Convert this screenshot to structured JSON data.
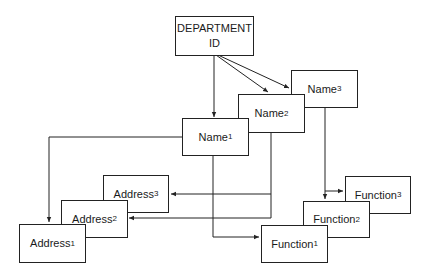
{
  "diagram": {
    "root": {
      "line1": "DEPARTMENT",
      "line2": "ID"
    },
    "names": [
      {
        "label": "Name",
        "sub": "1"
      },
      {
        "label": "Name",
        "sub": "2"
      },
      {
        "label": "Name",
        "sub": "3"
      }
    ],
    "addresses": [
      {
        "label": "Address",
        "sub": "1"
      },
      {
        "label": "Address",
        "sub": "2"
      },
      {
        "label": "Address",
        "sub": "3"
      }
    ],
    "functions": [
      {
        "label": "Function",
        "sub": "1"
      },
      {
        "label": "Function",
        "sub": "2"
      },
      {
        "label": "Function",
        "sub": "3"
      }
    ],
    "colors": {
      "line": "#222222",
      "background": "#ffffff"
    }
  }
}
